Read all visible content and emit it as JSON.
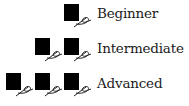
{
  "legend": {
    "title": "Skill level",
    "items": [
      {
        "label": "Beginner",
        "spools": 1
      },
      {
        "label": "Intermediate",
        "spools": 2
      },
      {
        "label": "Advanced",
        "spools": 3
      }
    ],
    "icon": "thread-spool-with-needle-icon",
    "icon_color": "#000000"
  }
}
